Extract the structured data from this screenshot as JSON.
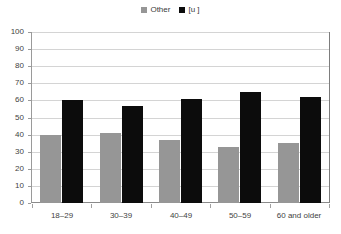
{
  "chart_data": {
    "type": "bar",
    "title": "",
    "subtitle": "",
    "xlabel": "",
    "ylabel": "",
    "categories": [
      "18–29",
      "30–39",
      "40–49",
      "50–59",
      "60 and older"
    ],
    "series": [
      {
        "name": "Other",
        "color": "#969696",
        "values": [
          40,
          41,
          37,
          33,
          35
        ]
      },
      {
        "name": "[u ]",
        "color": "#0c0c0c",
        "values": [
          60,
          57,
          61,
          65,
          62
        ]
      }
    ],
    "ylim": [
      0,
      100
    ],
    "ytick_labels": [
      "100",
      "90",
      "80",
      "70",
      "60",
      "50",
      "40",
      "30",
      "20",
      "10",
      "0"
    ],
    "ytick_values": [
      100,
      90,
      80,
      70,
      60,
      50,
      40,
      30,
      20,
      10,
      0
    ],
    "grid": true,
    "grid_axis": "y",
    "legend": {
      "position": "top-center",
      "visible": true
    },
    "bar_mode": "grouped"
  },
  "legend": {
    "entries": [
      {
        "label": "Other",
        "swatch_name": "legend-swatch-other"
      },
      {
        "label": "[u ]",
        "swatch_name": "legend-swatch-u"
      }
    ]
  },
  "colors": {
    "series_other": "#969696",
    "series_u": "#0c0c0c",
    "gridline": "#d4d4d4",
    "axis": "#8a8a8a",
    "text": "#3f3f3f",
    "background": "#ffffff"
  }
}
